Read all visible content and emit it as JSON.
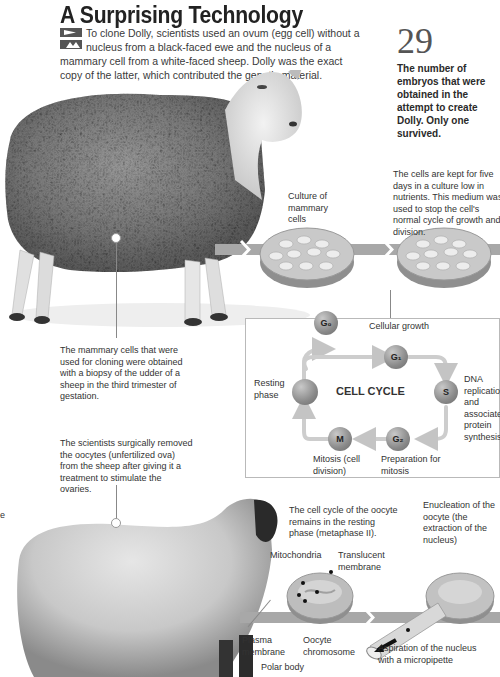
{
  "header": {
    "title": "A Surprising Technology",
    "intro": "To clone Dolly, scientists used an ovum (egg cell) without a nucleus from a black-faced ewe and the nucleus of a mammary cell from a white-faced sheep. Dolly was the exact copy of the latter, which contributed the genetic material."
  },
  "factoid": {
    "number": "29",
    "text": "The number of embryos that were obtained in the attempt to create Dolly. Only one survived."
  },
  "top_section": {
    "culture_label": "Culture of mammary cells",
    "culture_note": "The cells are kept for five days in a culture low in nutrients. This medium was used to stop the cell's normal cycle of growth and division.",
    "biopsy_note": "The mammary cells that were used for cloning were obtained with a biopsy of the udder of a sheep in the third trimester of gestation."
  },
  "cell_cycle": {
    "title": "CELL CYCLE",
    "nodes": {
      "g0": "G₀",
      "g1": "G₁",
      "s": "S",
      "g2": "G₂",
      "m": "M"
    },
    "labels": {
      "cellular_growth": "Cellular growth",
      "resting_phase": "Resting phase",
      "dna": "DNA replication and associated protein synthesis",
      "mitosis": "Mitosis (cell division)",
      "prep_mitosis": "Preparation for mitosis"
    }
  },
  "bottom_section": {
    "oocyte_note": "The scientists surgically removed the oocytes (unfertilized ova) from the sheep after giving it a treatment to stimulate the ovaries.",
    "left_edge_fragment": "e",
    "resting_note": "The cell cycle of the oocyte remains in the resting phase (metaphase II).",
    "enucleation_note": "Enucleation of the oocyte (the extraction of the nucleus)",
    "mitochondria": "Mitochondria",
    "translucent_membrane": "Translucent membrane",
    "plasma_membrane": "Plasma membrane",
    "oocyte_chromosome": "Oocyte chromosome",
    "polar_body": "Polar body",
    "aspiration": "Aspiration of the nucleus with a micropipette"
  },
  "colors": {
    "band": "#a8a8a8",
    "node": "#8a8a8a",
    "box_border": "#b9b9b9",
    "title": "#222222"
  }
}
